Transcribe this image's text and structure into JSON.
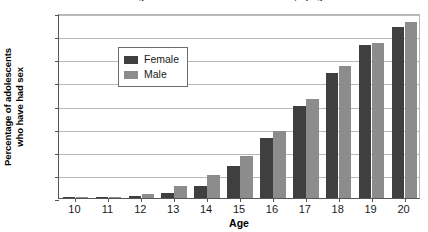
{
  "chart_data": {
    "type": "bar",
    "title": "Percentage of adolescents who have had sex, by age",
    "xlabel": "Age",
    "ylabel_line1": "Percentage of adolescents",
    "ylabel_line2": "who have had sex",
    "categories": [
      "10",
      "11",
      "12",
      "13",
      "14",
      "15",
      "16",
      "17",
      "18",
      "19",
      "20"
    ],
    "series": [
      {
        "name": "Female",
        "color": "#3f3f3f",
        "values": [
          0.2,
          0.3,
          0.7,
          2,
          5,
          14,
          26,
          40,
          54,
          66,
          74
        ]
      },
      {
        "name": "Male",
        "color": "#8c8c8c",
        "values": [
          0.4,
          0.6,
          1.7,
          5,
          10,
          18,
          29,
          43,
          57,
          67,
          76
        ]
      }
    ],
    "ylim": [
      0,
      80
    ],
    "yticks": [
      "0",
      "10",
      "20",
      "30",
      "40",
      "50",
      "60",
      "70",
      "80"
    ],
    "ytick_values": [
      0,
      10,
      20,
      30,
      40,
      50,
      60,
      70,
      80
    ],
    "grid": true,
    "legend_position": "upper-left-inside"
  }
}
